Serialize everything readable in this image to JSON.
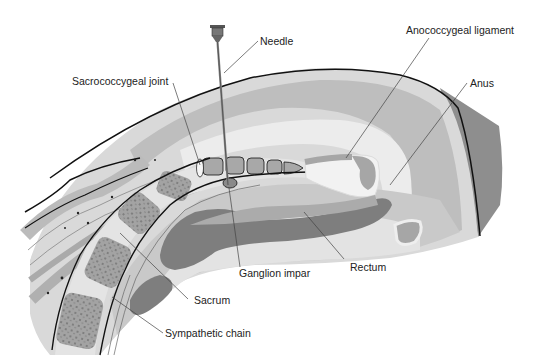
{
  "figure": {
    "colors": {
      "background": "#ffffff",
      "skin_dark": "#8a8a8a",
      "tissue_light": "#d6d6d6",
      "tissue_mid": "#bdbdbd",
      "tissue_pale": "#e8e8e8",
      "rectum_dark": "#7d7d7d",
      "rectum_mid": "#a8a8a8",
      "bone": "#9c9c9c",
      "bone_border": "#e4e4e4",
      "outline": "#111111",
      "leader": "#444444"
    }
  },
  "labels": {
    "needle": "Needle",
    "sacrococcygeal_joint": "Sacrococcygeal joint",
    "anococcygeal_ligament": "Anococcygeal ligament",
    "anus": "Anus",
    "ganglion_impar": "Ganglion impar",
    "rectum": "Rectum",
    "sacrum": "Sacrum",
    "sympathetic_chain": "Sympathetic chain"
  }
}
